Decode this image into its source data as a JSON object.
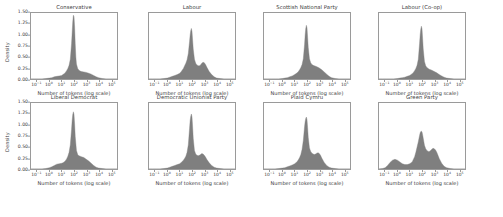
{
  "figure": {
    "layout": "2 rows x 4 columns small-multiples",
    "background": "#ffffff",
    "fill_color": "#7f7f7f",
    "axis_color": "#9a9a9a",
    "text_color": "#3b3b3b"
  },
  "axes": {
    "ylabel": "Density",
    "xlabel_default": "Number of tokens (log scale)",
    "yticks": [
      "0.00",
      "0.25",
      "0.50",
      "0.75",
      "1.00",
      "1.25",
      "1.50"
    ],
    "ytick_values": [
      0.0,
      0.25,
      0.5,
      0.75,
      1.0,
      1.25,
      1.5
    ],
    "ylim": [
      0.0,
      1.5
    ],
    "xticks": [
      "10⁻¹",
      "10⁰",
      "10¹",
      "10²",
      "10³",
      "10⁴",
      "10⁵"
    ],
    "xtick_exponents": [
      -1,
      0,
      1,
      2,
      3,
      4,
      5
    ],
    "xlim": [
      -1.5,
      5.5
    ],
    "grid": false,
    "legend": "none"
  },
  "chart_data": {
    "type": "area",
    "title": "",
    "xlabel": "Number of tokens (log scale)",
    "ylabel": "Density",
    "xlim": [
      -1.5,
      5.5
    ],
    "ylim": [
      0.0,
      1.5
    ],
    "x_is_log10": true,
    "grid": false,
    "panels": [
      {
        "title": "Conservative",
        "row": 0,
        "col": 0,
        "xlabel": "Number of tokens (log scale)",
        "ylabel": "Density",
        "peak_value": 1.45,
        "peak_x_log10": 1.95,
        "x": [
          -1.5,
          -1.2,
          -0.9,
          -0.6,
          -0.3,
          0.0,
          0.2,
          0.4,
          0.6,
          0.8,
          1.0,
          1.1,
          1.2,
          1.3,
          1.4,
          1.5,
          1.6,
          1.7,
          1.8,
          1.85,
          1.9,
          1.95,
          2.0,
          2.05,
          2.1,
          2.15,
          2.2,
          2.3,
          2.4,
          2.5,
          2.6,
          2.8,
          3.0,
          3.2,
          3.4,
          3.6,
          3.8,
          4.0,
          4.3,
          4.6,
          5.0,
          5.5
        ],
        "y": [
          0.0,
          0.0,
          0.0,
          0.0,
          0.01,
          0.02,
          0.03,
          0.05,
          0.06,
          0.07,
          0.08,
          0.1,
          0.12,
          0.15,
          0.19,
          0.24,
          0.31,
          0.45,
          0.8,
          1.05,
          1.3,
          1.45,
          1.42,
          1.18,
          0.8,
          0.5,
          0.34,
          0.24,
          0.2,
          0.18,
          0.17,
          0.16,
          0.15,
          0.13,
          0.11,
          0.08,
          0.05,
          0.03,
          0.01,
          0.0,
          0.0,
          0.0
        ]
      },
      {
        "title": "Labour",
        "row": 0,
        "col": 1,
        "xlabel": "Number of tokens (log scale)",
        "ylabel": "",
        "peak_value": 1.15,
        "peak_x_log10": 1.95,
        "x": [
          -1.5,
          -1.2,
          -0.9,
          -0.6,
          -0.3,
          0.0,
          0.2,
          0.4,
          0.6,
          0.8,
          1.0,
          1.1,
          1.2,
          1.3,
          1.4,
          1.5,
          1.6,
          1.7,
          1.8,
          1.85,
          1.9,
          1.95,
          2.0,
          2.05,
          2.1,
          2.2,
          2.3,
          2.4,
          2.5,
          2.6,
          2.7,
          2.8,
          2.9,
          3.0,
          3.1,
          3.2,
          3.4,
          3.6,
          3.8,
          4.0,
          4.3,
          4.6,
          5.0,
          5.5
        ],
        "y": [
          0.0,
          0.0,
          0.0,
          0.0,
          0.01,
          0.02,
          0.04,
          0.06,
          0.08,
          0.1,
          0.13,
          0.16,
          0.2,
          0.24,
          0.3,
          0.36,
          0.44,
          0.58,
          0.85,
          1.0,
          1.1,
          1.15,
          1.08,
          0.88,
          0.68,
          0.45,
          0.36,
          0.32,
          0.3,
          0.3,
          0.32,
          0.36,
          0.38,
          0.37,
          0.33,
          0.27,
          0.17,
          0.1,
          0.05,
          0.02,
          0.01,
          0.0,
          0.0,
          0.0
        ]
      },
      {
        "title": "Scottish National Party",
        "row": 0,
        "col": 2,
        "xlabel": "Number of tokens (log scale)",
        "ylabel": "",
        "peak_value": 1.22,
        "peak_x_log10": 1.95,
        "x": [
          -1.5,
          -1.2,
          -0.9,
          -0.6,
          -0.3,
          0.0,
          0.2,
          0.4,
          0.6,
          0.8,
          1.0,
          1.2,
          1.3,
          1.4,
          1.5,
          1.6,
          1.7,
          1.8,
          1.85,
          1.9,
          1.95,
          2.0,
          2.05,
          2.1,
          2.2,
          2.3,
          2.4,
          2.5,
          2.6,
          2.8,
          3.0,
          3.2,
          3.4,
          3.6,
          3.8,
          4.0,
          4.3,
          4.6,
          5.0,
          5.5
        ],
        "y": [
          0.0,
          0.0,
          0.0,
          0.0,
          0.0,
          0.01,
          0.02,
          0.03,
          0.05,
          0.07,
          0.1,
          0.14,
          0.17,
          0.21,
          0.26,
          0.33,
          0.46,
          0.78,
          1.0,
          1.15,
          1.22,
          1.16,
          0.95,
          0.72,
          0.46,
          0.37,
          0.33,
          0.31,
          0.3,
          0.28,
          0.25,
          0.21,
          0.16,
          0.11,
          0.06,
          0.03,
          0.01,
          0.0,
          0.0,
          0.0
        ]
      },
      {
        "title": "Labour (Co-op)",
        "row": 0,
        "col": 3,
        "xlabel": "Number of tokens (log scale)",
        "ylabel": "",
        "peak_value": 1.2,
        "peak_x_log10": 1.95,
        "x": [
          -1.5,
          -1.2,
          -0.9,
          -0.6,
          -0.3,
          0.0,
          0.2,
          0.4,
          0.6,
          0.8,
          1.0,
          1.2,
          1.3,
          1.4,
          1.5,
          1.6,
          1.7,
          1.8,
          1.85,
          1.9,
          1.95,
          2.0,
          2.05,
          2.1,
          2.2,
          2.3,
          2.4,
          2.5,
          2.6,
          2.8,
          3.0,
          3.2,
          3.4,
          3.6,
          3.8,
          4.0,
          4.3,
          4.6,
          5.0,
          5.5
        ],
        "y": [
          0.0,
          0.0,
          0.0,
          0.0,
          0.0,
          0.01,
          0.02,
          0.03,
          0.04,
          0.06,
          0.08,
          0.12,
          0.15,
          0.19,
          0.24,
          0.31,
          0.45,
          0.8,
          1.0,
          1.13,
          1.2,
          1.14,
          0.92,
          0.68,
          0.4,
          0.3,
          0.26,
          0.24,
          0.22,
          0.2,
          0.17,
          0.14,
          0.1,
          0.07,
          0.04,
          0.02,
          0.01,
          0.0,
          0.0,
          0.0
        ]
      },
      {
        "title": "Liberal Democrat",
        "row": 1,
        "col": 0,
        "xlabel": "Number of tokens (log scale)",
        "ylabel": "Density",
        "peak_value": 1.3,
        "peak_x_log10": 1.95,
        "x": [
          -1.5,
          -1.2,
          -0.9,
          -0.6,
          -0.3,
          0.0,
          0.2,
          0.4,
          0.6,
          0.8,
          1.0,
          1.1,
          1.2,
          1.3,
          1.4,
          1.5,
          1.6,
          1.7,
          1.8,
          1.85,
          1.9,
          1.95,
          2.0,
          2.05,
          2.1,
          2.2,
          2.3,
          2.4,
          2.5,
          2.6,
          2.8,
          3.0,
          3.2,
          3.4,
          3.6,
          3.8,
          4.0,
          4.3,
          4.6,
          5.0,
          5.5
        ],
        "y": [
          0.0,
          0.0,
          0.0,
          0.0,
          0.01,
          0.03,
          0.05,
          0.08,
          0.11,
          0.12,
          0.13,
          0.14,
          0.16,
          0.19,
          0.23,
          0.29,
          0.38,
          0.55,
          0.9,
          1.1,
          1.24,
          1.3,
          1.24,
          1.02,
          0.74,
          0.42,
          0.33,
          0.3,
          0.29,
          0.28,
          0.26,
          0.22,
          0.18,
          0.13,
          0.08,
          0.04,
          0.02,
          0.01,
          0.0,
          0.0,
          0.0
        ]
      },
      {
        "title": "Democratic Unionist Party",
        "row": 1,
        "col": 1,
        "xlabel": "Number of tokens (log scale)",
        "ylabel": "",
        "peak_value": 1.25,
        "peak_x_log10": 1.95,
        "x": [
          -1.5,
          -1.2,
          -0.9,
          -0.6,
          -0.3,
          0.0,
          0.2,
          0.4,
          0.6,
          0.8,
          1.0,
          1.1,
          1.2,
          1.3,
          1.4,
          1.5,
          1.6,
          1.7,
          1.8,
          1.85,
          1.9,
          1.95,
          2.0,
          2.05,
          2.1,
          2.2,
          2.3,
          2.4,
          2.5,
          2.6,
          2.7,
          2.8,
          2.9,
          3.0,
          3.1,
          3.2,
          3.4,
          3.6,
          3.8,
          4.0,
          4.3,
          4.6,
          5.0,
          5.5
        ],
        "y": [
          0.0,
          0.0,
          0.0,
          0.0,
          0.01,
          0.02,
          0.04,
          0.06,
          0.08,
          0.1,
          0.12,
          0.14,
          0.17,
          0.2,
          0.24,
          0.29,
          0.38,
          0.55,
          0.92,
          1.1,
          1.2,
          1.25,
          1.18,
          0.96,
          0.7,
          0.42,
          0.34,
          0.31,
          0.3,
          0.31,
          0.33,
          0.35,
          0.34,
          0.31,
          0.27,
          0.22,
          0.14,
          0.08,
          0.04,
          0.02,
          0.01,
          0.0,
          0.0,
          0.0
        ]
      },
      {
        "title": "Plaid Cymru",
        "row": 1,
        "col": 2,
        "xlabel": "Number of tokens (log scale)",
        "ylabel": "",
        "peak_value": 1.18,
        "peak_x_log10": 1.95,
        "x": [
          -1.5,
          -1.2,
          -0.9,
          -0.6,
          -0.3,
          0.0,
          0.2,
          0.4,
          0.6,
          0.8,
          1.0,
          1.1,
          1.2,
          1.3,
          1.4,
          1.5,
          1.6,
          1.7,
          1.8,
          1.85,
          1.9,
          1.95,
          2.0,
          2.05,
          2.1,
          2.2,
          2.3,
          2.4,
          2.5,
          2.6,
          2.7,
          2.8,
          2.9,
          3.0,
          3.1,
          3.2,
          3.4,
          3.6,
          3.8,
          4.0,
          4.3,
          4.6,
          5.0,
          5.5
        ],
        "y": [
          0.0,
          0.0,
          0.0,
          0.0,
          0.01,
          0.02,
          0.03,
          0.05,
          0.07,
          0.09,
          0.12,
          0.14,
          0.17,
          0.21,
          0.26,
          0.33,
          0.45,
          0.65,
          0.96,
          1.08,
          1.15,
          1.18,
          1.12,
          0.94,
          0.72,
          0.48,
          0.4,
          0.36,
          0.34,
          0.33,
          0.34,
          0.36,
          0.37,
          0.35,
          0.31,
          0.25,
          0.15,
          0.08,
          0.04,
          0.02,
          0.01,
          0.0,
          0.0,
          0.0
        ]
      },
      {
        "title": "Green Party",
        "row": 1,
        "col": 3,
        "xlabel": "Number of tokens (log scale)",
        "ylabel": "",
        "peak_value": 0.86,
        "peak_x_log10": 1.95,
        "x": [
          -1.5,
          -1.2,
          -1.0,
          -0.8,
          -0.6,
          -0.4,
          -0.2,
          0.0,
          0.2,
          0.4,
          0.6,
          0.8,
          1.0,
          1.2,
          1.4,
          1.5,
          1.6,
          1.7,
          1.8,
          1.85,
          1.9,
          1.95,
          2.0,
          2.05,
          2.1,
          2.2,
          2.3,
          2.4,
          2.5,
          2.6,
          2.7,
          2.8,
          2.9,
          3.0,
          3.1,
          3.2,
          3.3,
          3.4,
          3.6,
          3.8,
          4.0,
          4.3,
          4.6,
          5.0,
          5.5
        ],
        "y": [
          0.0,
          0.01,
          0.03,
          0.08,
          0.15,
          0.2,
          0.22,
          0.2,
          0.16,
          0.12,
          0.1,
          0.1,
          0.12,
          0.16,
          0.28,
          0.38,
          0.5,
          0.62,
          0.76,
          0.82,
          0.85,
          0.86,
          0.84,
          0.78,
          0.7,
          0.54,
          0.46,
          0.42,
          0.4,
          0.4,
          0.42,
          0.45,
          0.47,
          0.46,
          0.43,
          0.38,
          0.31,
          0.24,
          0.13,
          0.06,
          0.03,
          0.01,
          0.0,
          0.0,
          0.0
        ]
      }
    ]
  }
}
